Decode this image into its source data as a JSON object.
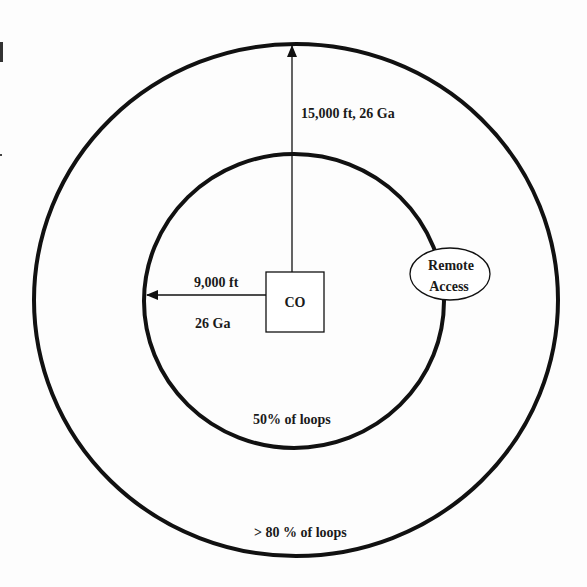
{
  "diagram": {
    "type": "concentric-loop-coverage",
    "center_node": {
      "label": "CO"
    },
    "remote_node": {
      "label_line1": "Remote",
      "label_line2": "Access"
    },
    "outer_ring": {
      "radius_label": "15,000 ft, 26 Ga",
      "coverage_label": "> 80 % of loops"
    },
    "inner_ring": {
      "radius_label_top": "9,000 ft",
      "radius_label_bottom": "26 Ga",
      "coverage_label": "50% of loops"
    },
    "colors": {
      "stroke": "#111111",
      "background": "#fdfdfd"
    }
  }
}
